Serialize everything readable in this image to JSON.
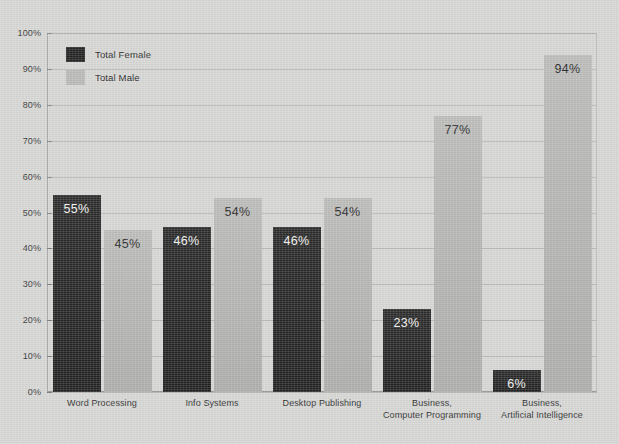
{
  "chart_data": {
    "type": "bar",
    "title": "",
    "xlabel": "",
    "ylabel": "",
    "ylim": [
      0,
      100
    ],
    "grid": true,
    "legend_position": "top-left-inside",
    "categories": [
      "Word Processing",
      "Info Systems",
      "Desktop Publishing",
      "Business, Computer Programming",
      "Business, Artificial Intelligence"
    ],
    "category_lines": [
      [
        "Word Processing"
      ],
      [
        "Info Systems"
      ],
      [
        "Desktop Publishing"
      ],
      [
        "Business,",
        "Computer Programming"
      ],
      [
        "Business,",
        "Artificial Intelligence"
      ]
    ],
    "series": [
      {
        "name": "Total Female",
        "color": "#242424",
        "values": [
          55,
          46,
          46,
          23,
          6
        ],
        "labels": [
          "55%",
          "46%",
          "46%",
          "23%",
          "6%"
        ]
      },
      {
        "name": "Total Male",
        "color": "#b4b4b2",
        "values": [
          45,
          54,
          54,
          77,
          94
        ],
        "labels": [
          "45%",
          "54%",
          "54%",
          "77%",
          "94%"
        ]
      }
    ],
    "ytick_values": [
      0,
      10,
      20,
      30,
      40,
      50,
      60,
      70,
      80,
      90,
      100
    ],
    "ytick_labels": [
      "0%",
      "10%",
      "20%",
      "30%",
      "40%",
      "50%",
      "60%",
      "70%",
      "80%",
      "90%",
      "100%"
    ]
  },
  "legend": {
    "items": [
      {
        "label": "Total Female",
        "color": "#242424"
      },
      {
        "label": "Total Male",
        "color": "#b9b9b7"
      }
    ]
  },
  "colors": {
    "background": "#d6d6d4",
    "female_bar": "#242424",
    "male_bar": "#b4b4b2",
    "gridline": "#b9b9b7",
    "axis_text": "#2e2e2e"
  }
}
